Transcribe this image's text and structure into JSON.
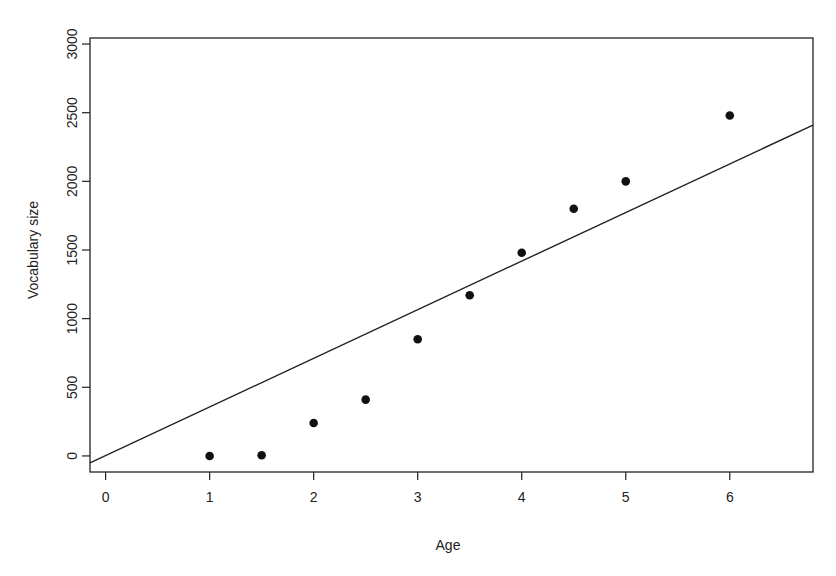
{
  "chart_data": {
    "type": "scatter",
    "title": "",
    "xlabel": "Age",
    "ylabel": "Vocabulary size",
    "xlim": [
      -0.15,
      6.8
    ],
    "ylim": [
      -117,
      3044
    ],
    "grid": false,
    "legend": null,
    "x_ticks": [
      0,
      1,
      2,
      3,
      4,
      5,
      6
    ],
    "x_tick_labels": [
      "0",
      "1",
      "2",
      "3",
      "4",
      "5",
      "6"
    ],
    "y_ticks": [
      0,
      500,
      1000,
      1500,
      2000,
      2500,
      3000
    ],
    "y_tick_labels": [
      "0",
      "500",
      "1000",
      "1500",
      "2000",
      "2500",
      "3000"
    ],
    "series": [
      {
        "name": "Observed",
        "type": "scatter",
        "x": [
          1,
          1.5,
          2,
          2.5,
          3,
          3.5,
          4,
          4.5,
          5,
          6
        ],
        "y": [
          0,
          5,
          240,
          410,
          850,
          1170,
          1480,
          1800,
          2000,
          2480
        ]
      },
      {
        "name": "Regression line",
        "type": "line",
        "x": [
          -0.15,
          6.8
        ],
        "y": [
          -50,
          2410
        ]
      }
    ]
  },
  "labels": {
    "xlabel": "Age",
    "ylabel": "Vocabulary size"
  }
}
